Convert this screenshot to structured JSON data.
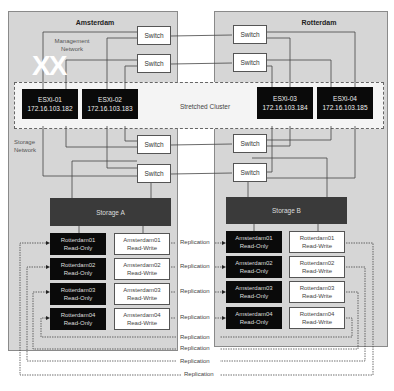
{
  "sites": {
    "left": {
      "title": "Amsterdam"
    },
    "right": {
      "title": "Rotterdam"
    }
  },
  "annotations": {
    "management_network": "Management\nNetwork",
    "management_line1": "Management",
    "management_line2": "Network",
    "storage_line1": "Storage",
    "storage_line2": "Network",
    "watermark": "XX"
  },
  "switches": {
    "left": [
      "Switch",
      "Switch",
      "Switch",
      "Switch"
    ],
    "right": [
      "Switch",
      "Switch",
      "Switch",
      "Switch"
    ]
  },
  "cluster": {
    "label": "Stretched Cluster"
  },
  "hosts": [
    {
      "name": "ESXi-01",
      "ip": "172.16.103.182"
    },
    {
      "name": "ESXi-02",
      "ip": "172.16.103.183"
    },
    {
      "name": "ESXi-03",
      "ip": "172.16.103.184"
    },
    {
      "name": "ESXi-04",
      "ip": "172.16.103.185"
    }
  ],
  "storage": {
    "left": "Storage A",
    "right": "Storage B"
  },
  "volumes": {
    "left": [
      {
        "ro_name": "Rotterdam01",
        "ro_mode": "Read-Only",
        "rw_name": "Amsterdam01",
        "rw_mode": "Read-Write"
      },
      {
        "ro_name": "Rotterdam02",
        "ro_mode": "Read-Only",
        "rw_name": "Amsterdam02",
        "rw_mode": "Read-Write"
      },
      {
        "ro_name": "Rotterdam03",
        "ro_mode": "Read-Only",
        "rw_name": "Amsterdam03",
        "rw_mode": "Read-Write"
      },
      {
        "ro_name": "Rotterdam04",
        "ro_mode": "Read-Only",
        "rw_name": "Amsterdam04",
        "rw_mode": "Read-Write"
      }
    ],
    "right": [
      {
        "ro_name": "Amsterdam01",
        "ro_mode": "Read-Only",
        "rw_name": "Rotterdam01",
        "rw_mode": "Read-Write"
      },
      {
        "ro_name": "Amsterdam02",
        "ro_mode": "Read-Only",
        "rw_name": "Rotterdam02",
        "rw_mode": "Read-Write"
      },
      {
        "ro_name": "Amsterdam03",
        "ro_mode": "Read-Only",
        "rw_name": "Rotterdam03",
        "rw_mode": "Read-Write"
      },
      {
        "ro_name": "Amsterdam04",
        "ro_mode": "Read-Only",
        "rw_name": "Rotterdam04",
        "rw_mode": "Read-Write"
      }
    ]
  },
  "replication": {
    "label": "Replication",
    "forward": [
      "Replication",
      "Replication",
      "Replication",
      "Replication"
    ],
    "reverse": [
      "Replication",
      "Replication",
      "Replication",
      "Replication"
    ]
  },
  "colors": {
    "site_bg": "#d6d6d6",
    "host_bg": "#0a0a0a",
    "storage_bg": "#3a3a3a",
    "cluster_bg": "#f4f4f4"
  }
}
